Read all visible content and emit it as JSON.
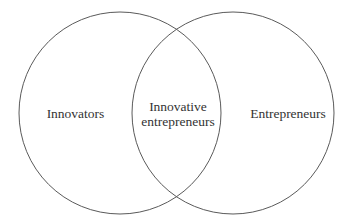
{
  "diagram": {
    "type": "venn",
    "sets": [
      {
        "id": "left",
        "label": "Innovators",
        "cx": 120,
        "cy": 113,
        "r": 101
      },
      {
        "id": "right",
        "label": "Entrepreneurs",
        "cx": 233,
        "cy": 113,
        "r": 101
      }
    ],
    "intersection": {
      "line1": "Innovative",
      "line2": "entrepreneurs"
    },
    "colors": {
      "stroke": "#5a5a5a",
      "text": "#333333",
      "background": "#ffffff"
    }
  }
}
